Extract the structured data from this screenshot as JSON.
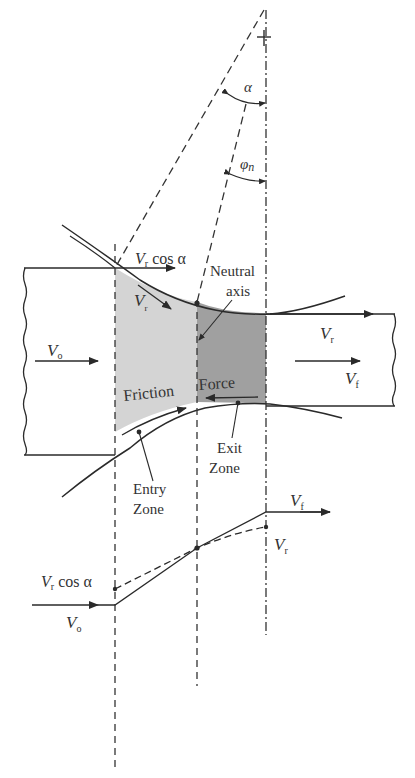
{
  "diagram": {
    "angles": {
      "alpha": "α",
      "phi_n": "φ",
      "phi_sub": "n"
    },
    "labels": {
      "vr_cos_alpha_top": {
        "v": "V",
        "sub": "r",
        "rest": " cos α"
      },
      "vr_roll": {
        "v": "V",
        "sub": "r"
      },
      "neutral_axis_line1": "Neutral",
      "neutral_axis_line2": "axis",
      "v0": {
        "v": "V",
        "sub": "o"
      },
      "vr_exit": {
        "v": "V",
        "sub": "r"
      },
      "vf_exit": {
        "v": "V",
        "sub": "f"
      },
      "friction": "Friction",
      "force": "Force",
      "exit_zone_line1": "Exit",
      "exit_zone_line2": "Zone",
      "entry_zone_line1": "Entry",
      "entry_zone_line2": "Zone"
    },
    "velocity_plot": {
      "vf": {
        "v": "V",
        "sub": "f"
      },
      "vr": {
        "v": "V",
        "sub": "r"
      },
      "vr_cos_alpha": {
        "v": "V",
        "sub": "r",
        "rest": " cos α"
      },
      "v0": {
        "v": "V",
        "sub": "o"
      }
    },
    "colors": {
      "entry_zone_fill": "#d4d4d4",
      "exit_zone_fill": "#a0a0a0",
      "line": "#2a2a2a"
    }
  }
}
